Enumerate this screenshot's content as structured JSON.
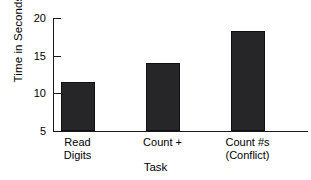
{
  "chart_data": {
    "type": "bar",
    "title": "",
    "xlabel": "Task",
    "ylabel": "Time in Seconds",
    "categories": [
      "Read Digits",
      "Count +",
      "Count #s (Conflict)"
    ],
    "category_lines": [
      [
        "Read",
        "Digits"
      ],
      [
        "Count +"
      ],
      [
        "Count #s",
        "(Conflict)"
      ]
    ],
    "values": [
      11.5,
      14.0,
      18.3
    ],
    "ylim": [
      5,
      20
    ],
    "yticks": [
      5,
      10,
      15,
      20
    ],
    "ytick_labels": [
      "5",
      "10",
      "15",
      "20"
    ],
    "grid": false,
    "legend": false,
    "bar_color": "#262628",
    "axis_color": "#1a1a1a",
    "background_color": "#ffffff"
  },
  "axes": {
    "y_title": "Time in Seconds",
    "x_title": "Task"
  }
}
